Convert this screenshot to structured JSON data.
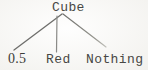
{
  "diagram": {
    "type": "tree",
    "root": {
      "label": "Cube"
    },
    "children": [
      {
        "label": "0.5"
      },
      {
        "label": "Red"
      },
      {
        "label": "Nothing"
      }
    ],
    "edges": [
      {
        "from": "Cube",
        "to": "0.5"
      },
      {
        "from": "Cube",
        "to": "Red"
      },
      {
        "from": "Cube",
        "to": "Nothing"
      }
    ]
  },
  "colors": {
    "background": "#f9f8f5",
    "text": "#474744",
    "edge_dark": "#6e6e6b",
    "edge_mid": "#8a8a87",
    "edge_faint": "#b5b5b1"
  }
}
